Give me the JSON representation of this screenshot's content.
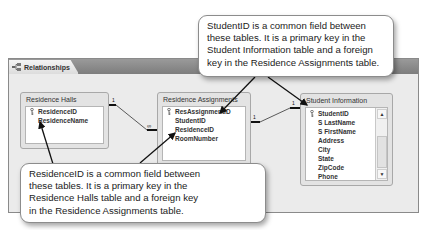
{
  "window": {
    "tab_label": "Relationships",
    "tab_icon": "relationships-icon"
  },
  "tables": {
    "residence_halls": {
      "title": "Residence Halls",
      "fields": [
        {
          "name": "ResidenceID",
          "primary_key": true
        },
        {
          "name": "ResidenceName",
          "primary_key": false
        }
      ]
    },
    "residence_assignments": {
      "title": "Residence Assignments",
      "fields": [
        {
          "name": "ResAssignmentID",
          "primary_key": true
        },
        {
          "name": "StudentID",
          "primary_key": false
        },
        {
          "name": "ResidenceID",
          "primary_key": false
        },
        {
          "name": "RoomNumber",
          "primary_key": false
        }
      ]
    },
    "student_information": {
      "title": "Student Information",
      "fields": [
        {
          "name": "StudentID",
          "primary_key": true
        },
        {
          "name": "S LastName",
          "primary_key": false
        },
        {
          "name": "S FirstName",
          "primary_key": false
        },
        {
          "name": "Address",
          "primary_key": false
        },
        {
          "name": "City",
          "primary_key": false
        },
        {
          "name": "State",
          "primary_key": false
        },
        {
          "name": "ZipCode",
          "primary_key": false
        },
        {
          "name": "Phone",
          "primary_key": false
        }
      ],
      "scroll_up": "▲",
      "scroll_down": "▼"
    }
  },
  "relationships": [
    {
      "from": "Residence Halls.ResidenceID",
      "to": "Residence Assignments.ResidenceID",
      "one_label": "1",
      "many_label": "∞"
    },
    {
      "from": "Student Information.StudentID",
      "to": "Residence Assignments.StudentID",
      "one_label": "1",
      "many_label": "∞"
    }
  ],
  "callouts": {
    "top": {
      "lines": [
        "StudentID is a common field between",
        "these tables. It is a primary key in the",
        "Student Information table and a foreign",
        "key in the Residence Assignments table."
      ]
    },
    "bottom": {
      "lines": [
        "ResidenceID is a common field between",
        "these tables. It is a primary key in the",
        "Residence Halls table and a foreign key",
        "in the Residence Assignments table."
      ]
    }
  }
}
